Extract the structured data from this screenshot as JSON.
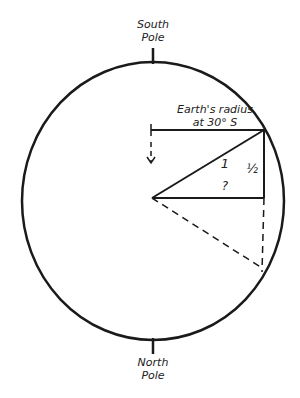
{
  "labels": {
    "top_pole": "South",
    "top_pole_2": "Pole",
    "bottom_pole": "North",
    "bottom_pole_2": "Pole",
    "radius_line1": "Earth's radius",
    "radius_line2": "at 30° S",
    "hypotenuse": "1",
    "opposite": "½",
    "adjacent": "?"
  },
  "colors": {
    "stroke": "#1a1a1a"
  }
}
